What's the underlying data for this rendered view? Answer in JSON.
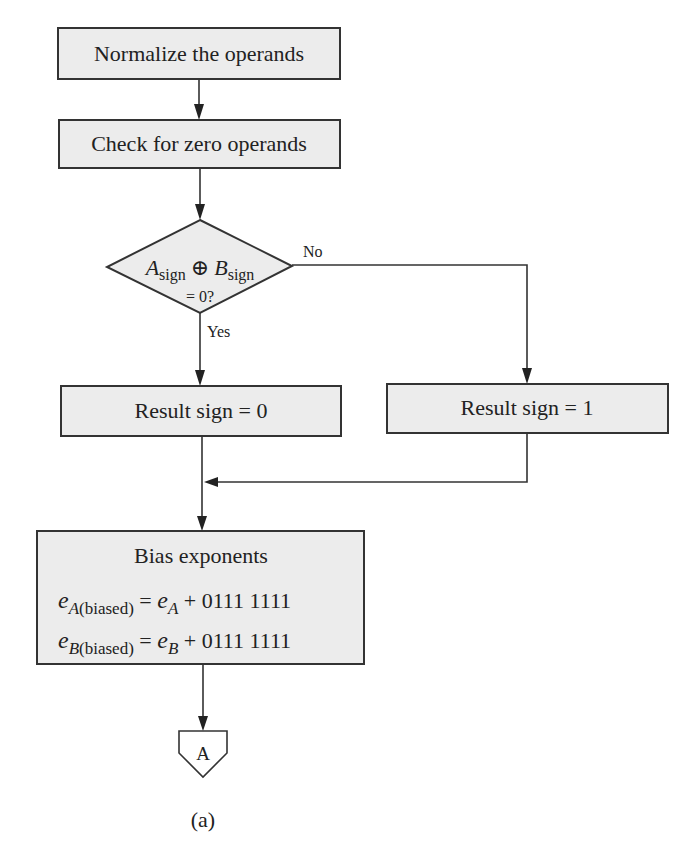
{
  "diagram": {
    "type": "flowchart",
    "caption": "(a)",
    "nodes": {
      "normalize": {
        "label": "Normalize the operands"
      },
      "check_zero": {
        "label": "Check for zero operands"
      },
      "decision": {
        "var_a": "A",
        "sub_a": "sign",
        "operator": "⊕",
        "var_b": "B",
        "sub_b": "sign",
        "line2": "= 0?"
      },
      "sign0": {
        "label": "Result sign = 0"
      },
      "sign1": {
        "label": "Result sign = 1"
      },
      "bias": {
        "title": "Bias exponents",
        "eq1": {
          "lhs_var": "e",
          "lhs_sub_var": "A",
          "lhs_sub_rest": "(biased)",
          "equals": " = ",
          "rhs_var": "e",
          "rhs_sub": "A",
          "rhs_rest": " + 0111 1111"
        },
        "eq2": {
          "lhs_var": "e",
          "lhs_sub_var": "B",
          "lhs_sub_rest": "(biased)",
          "equals": " = ",
          "rhs_var": "e",
          "rhs_sub": "B",
          "rhs_rest": " + 0111 1111"
        }
      },
      "connector": {
        "label": "A"
      }
    },
    "edge_labels": {
      "no": "No",
      "yes": "Yes"
    },
    "colors": {
      "box_fill": "#ececec",
      "stroke": "#333333",
      "background": "#ffffff"
    }
  }
}
